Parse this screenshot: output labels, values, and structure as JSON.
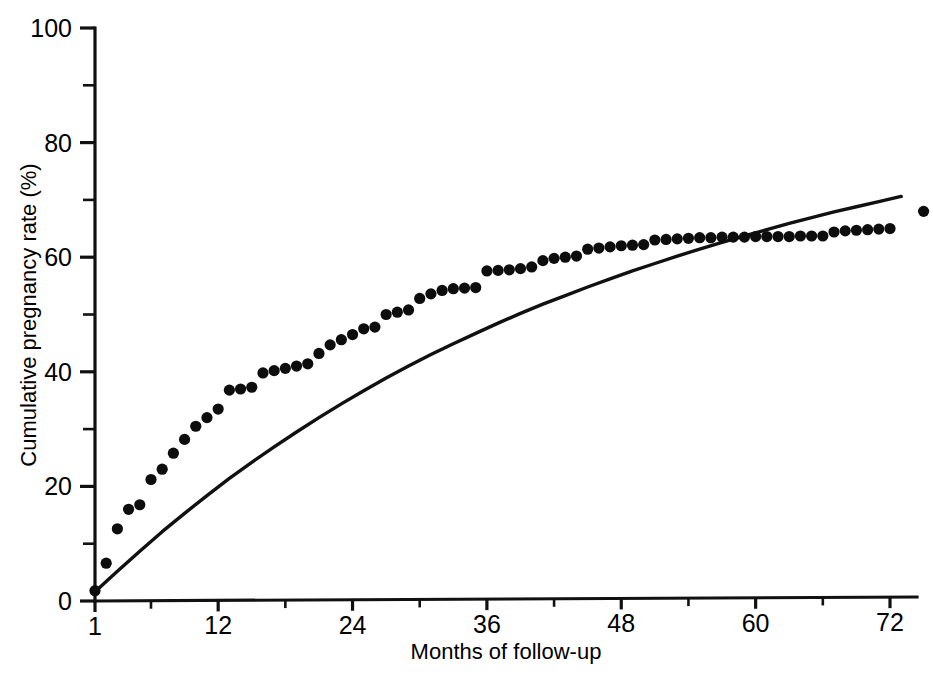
{
  "figure": {
    "background_color": "#ffffff",
    "ink_color": "#111111"
  },
  "axes": {
    "y_title": "Cumulative pregnancy rate (%)",
    "x_title": "Months of follow-up",
    "y_ticks": [
      "0",
      "20",
      "40",
      "60",
      "80",
      "100"
    ],
    "x_ticks": [
      "1",
      "12",
      "24",
      "36",
      "48",
      "60",
      "72"
    ]
  },
  "chart_data": {
    "type": "scatter",
    "title": "",
    "subtitle": "",
    "xlabel": "Months of follow-up",
    "ylabel": "Cumulative pregnancy rate (%)",
    "xlim": [
      1,
      75
    ],
    "ylim": [
      0,
      100
    ],
    "grid": false,
    "legend_position": "none",
    "y_tick_values": [
      0,
      20,
      40,
      60,
      80,
      100
    ],
    "y_minor_tick_values": [
      10,
      30,
      50,
      70,
      90
    ],
    "x_tick_values": [
      1,
      12,
      24,
      36,
      48,
      60,
      72
    ],
    "x_minor_tick_values": [
      6,
      18,
      30,
      42,
      54,
      66
    ],
    "annotations": [],
    "series": [
      {
        "name": "Observed cumulative pregnancy rate",
        "type": "scatter",
        "marker": "filled-circle",
        "color": "#0d0d0d",
        "points": [
          [
            1,
            1.8
          ],
          [
            2,
            6.6
          ],
          [
            3,
            12.6
          ],
          [
            4,
            16.0
          ],
          [
            5,
            16.8
          ],
          [
            6,
            21.2
          ],
          [
            7,
            23.0
          ],
          [
            8,
            25.8
          ],
          [
            9,
            28.2
          ],
          [
            10,
            30.5
          ],
          [
            11,
            32.0
          ],
          [
            12,
            33.5
          ],
          [
            13,
            36.8
          ],
          [
            14,
            37.0
          ],
          [
            15,
            37.3
          ],
          [
            16,
            39.8
          ],
          [
            17,
            40.2
          ],
          [
            18,
            40.6
          ],
          [
            19,
            41.0
          ],
          [
            20,
            41.4
          ],
          [
            21,
            43.2
          ],
          [
            22,
            44.7
          ],
          [
            23,
            45.6
          ],
          [
            24,
            46.5
          ],
          [
            25,
            47.5
          ],
          [
            26,
            47.8
          ],
          [
            27,
            50.0
          ],
          [
            28,
            50.4
          ],
          [
            29,
            50.8
          ],
          [
            30,
            52.8
          ],
          [
            31,
            53.6
          ],
          [
            32,
            54.2
          ],
          [
            33,
            54.5
          ],
          [
            34,
            54.6
          ],
          [
            35,
            54.7
          ],
          [
            36,
            57.6
          ],
          [
            37,
            57.7
          ],
          [
            38,
            57.8
          ],
          [
            39,
            58.0
          ],
          [
            40,
            58.3
          ],
          [
            41,
            59.4
          ],
          [
            42,
            59.8
          ],
          [
            43,
            60.0
          ],
          [
            44,
            60.2
          ],
          [
            45,
            61.4
          ],
          [
            46,
            61.6
          ],
          [
            47,
            61.8
          ],
          [
            48,
            62.0
          ],
          [
            49,
            62.1
          ],
          [
            50,
            62.2
          ],
          [
            51,
            63.0
          ],
          [
            52,
            63.1
          ],
          [
            53,
            63.2
          ],
          [
            54,
            63.3
          ],
          [
            55,
            63.4
          ],
          [
            56,
            63.4
          ],
          [
            57,
            63.5
          ],
          [
            58,
            63.5
          ],
          [
            59,
            63.5
          ],
          [
            60,
            63.6
          ],
          [
            61,
            63.6
          ],
          [
            62,
            63.6
          ],
          [
            63,
            63.6
          ],
          [
            64,
            63.7
          ],
          [
            65,
            63.7
          ],
          [
            66,
            63.7
          ],
          [
            67,
            64.4
          ],
          [
            68,
            64.6
          ],
          [
            69,
            64.7
          ],
          [
            70,
            64.8
          ],
          [
            71,
            64.9
          ],
          [
            72,
            65.0
          ],
          [
            75,
            68.0
          ]
        ]
      },
      {
        "name": "Fitted model curve",
        "type": "line",
        "color": "#111111",
        "points": [
          [
            1,
            1.6
          ],
          [
            3,
            5.2
          ],
          [
            5,
            8.7
          ],
          [
            7,
            12.1
          ],
          [
            9,
            15.3
          ],
          [
            11,
            18.4
          ],
          [
            13,
            21.4
          ],
          [
            15,
            24.2
          ],
          [
            17,
            26.9
          ],
          [
            19,
            29.5
          ],
          [
            21,
            32.0
          ],
          [
            23,
            34.4
          ],
          [
            25,
            36.7
          ],
          [
            27,
            38.9
          ],
          [
            29,
            41.0
          ],
          [
            31,
            43.0
          ],
          [
            33,
            44.9
          ],
          [
            35,
            46.7
          ],
          [
            37,
            48.5
          ],
          [
            39,
            50.2
          ],
          [
            41,
            51.8
          ],
          [
            43,
            53.3
          ],
          [
            45,
            54.8
          ],
          [
            47,
            56.2
          ],
          [
            49,
            57.6
          ],
          [
            51,
            58.9
          ],
          [
            53,
            60.2
          ],
          [
            55,
            61.4
          ],
          [
            57,
            62.6
          ],
          [
            59,
            63.7
          ],
          [
            61,
            64.8
          ],
          [
            63,
            65.9
          ],
          [
            65,
            66.9
          ],
          [
            67,
            67.9
          ],
          [
            69,
            68.8
          ],
          [
            71,
            69.7
          ],
          [
            73,
            70.6
          ],
          [
            75,
            71.4
          ],
          [
            77,
            72.2
          ],
          [
            79,
            73.0
          ],
          [
            81,
            73.8
          ],
          [
            83,
            74.5
          ],
          [
            85,
            75.2
          ],
          [
            87,
            75.8
          ],
          [
            89,
            76.5
          ],
          [
            91,
            77.1
          ],
          [
            93,
            77.7
          ],
          [
            95,
            78.3
          ],
          [
            96,
            78.6
          ]
        ]
      }
    ]
  }
}
